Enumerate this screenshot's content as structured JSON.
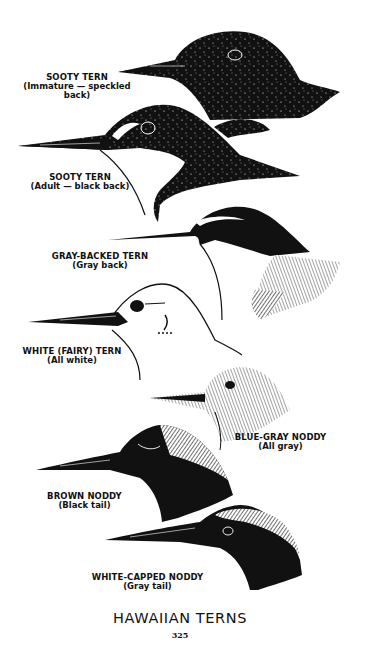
{
  "plate": {
    "title": "HAWAIIAN TERNS",
    "page_number": "325",
    "colors": {
      "ink": "#111111",
      "paper": "#ffffff",
      "gray": "#9a9a9a",
      "light_gray": "#c4c4c4"
    }
  },
  "birds": [
    {
      "name": "SOOTY TERN",
      "note": "(Immature — speckled back)",
      "icon": "sooty-tern-immature-head"
    },
    {
      "name": "SOOTY TERN",
      "note": "(Adult — black back)",
      "icon": "sooty-tern-adult-head"
    },
    {
      "name": "GRAY-BACKED TERN",
      "note": "(Gray back)",
      "icon": "gray-backed-tern-head"
    },
    {
      "name": "WHITE (FAIRY) TERN",
      "note": "(All white)",
      "icon": "white-fairy-tern-head"
    },
    {
      "name": "BLUE-GRAY NODDY",
      "note": "(All gray)",
      "icon": "blue-gray-noddy-head"
    },
    {
      "name": "BROWN NODDY",
      "note": "(Black tail)",
      "icon": "brown-noddy-head"
    },
    {
      "name": "WHITE-CAPPED NODDY",
      "note": "(Gray tail)",
      "icon": "white-capped-noddy-head"
    }
  ]
}
